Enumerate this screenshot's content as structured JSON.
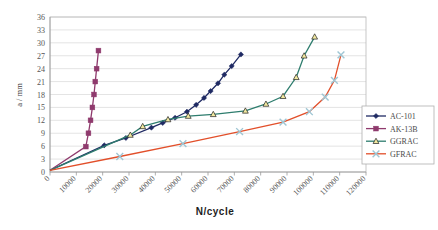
{
  "chart_data": {
    "type": "line",
    "title": "",
    "xlabel": "N/cycle",
    "ylabel": "a / mm",
    "xlim": [
      0,
      120000
    ],
    "ylim": [
      0,
      36
    ],
    "grid": true,
    "legend_position": "right-inside",
    "xticks": [
      0,
      10000,
      20000,
      30000,
      40000,
      50000,
      60000,
      70000,
      80000,
      90000,
      100000,
      110000,
      120000
    ],
    "xtick_labels": [
      "0",
      "10000",
      "20000",
      "30000",
      "40000",
      "50000",
      "60000",
      "70000",
      "80000",
      "90000",
      "100000",
      "110000",
      "120000"
    ],
    "yticks": [
      0,
      3,
      6,
      9,
      12,
      15,
      18,
      21,
      24,
      27,
      30,
      33,
      36
    ],
    "ytick_labels": [
      "0",
      "3",
      "6",
      "9",
      "12",
      "15",
      "18",
      "21",
      "24",
      "27",
      "30",
      "33",
      "36"
    ],
    "series": [
      {
        "name": "AC-101",
        "color": "#1f2a63",
        "marker": "diamond",
        "points": [
          [
            0,
            0.4
          ],
          [
            20600,
            6.2
          ],
          [
            28800,
            7.9
          ],
          [
            38500,
            10.3
          ],
          [
            42800,
            11.4
          ],
          [
            47500,
            12.6
          ],
          [
            52000,
            14.0
          ],
          [
            55500,
            15.6
          ],
          [
            58500,
            17.2
          ],
          [
            61000,
            18.8
          ],
          [
            63800,
            20.6
          ],
          [
            66200,
            22.6
          ],
          [
            69000,
            24.6
          ],
          [
            72500,
            27.3
          ]
        ]
      },
      {
        "name": "AK-13B",
        "color": "#8f3a6d",
        "marker": "square",
        "points": [
          [
            0,
            0.4
          ],
          [
            13600,
            5.9
          ],
          [
            14600,
            9.0
          ],
          [
            15400,
            12.0
          ],
          [
            16100,
            15.0
          ],
          [
            16700,
            18.0
          ],
          [
            17200,
            21.0
          ],
          [
            17700,
            24.0
          ],
          [
            18400,
            28.2
          ]
        ]
      },
      {
        "name": "GGRAC",
        "color": "#2e7d6e",
        "marker": "triangle",
        "points": [
          [
            0,
            0.4
          ],
          [
            30500,
            8.6
          ],
          [
            35200,
            10.6
          ],
          [
            44800,
            12.2
          ],
          [
            52500,
            13.0
          ],
          [
            62000,
            13.4
          ],
          [
            74200,
            14.2
          ],
          [
            82000,
            15.8
          ],
          [
            88500,
            17.6
          ],
          [
            93500,
            22.0
          ],
          [
            96500,
            27.0
          ],
          [
            100500,
            31.4
          ]
        ]
      },
      {
        "name": "GFRAC",
        "color": "#e24f2a",
        "marker": "cross",
        "points": [
          [
            0,
            0.4
          ],
          [
            26500,
            3.6
          ],
          [
            50500,
            6.6
          ],
          [
            72000,
            9.4
          ],
          [
            88500,
            11.6
          ],
          [
            98500,
            14.0
          ],
          [
            104500,
            17.4
          ],
          [
            108000,
            21.3
          ],
          [
            110500,
            27.2
          ]
        ]
      }
    ]
  },
  "legend": {
    "entries": [
      {
        "label": "AC-101",
        "color": "#1f2a63",
        "marker": "diamond"
      },
      {
        "label": "AK-13B",
        "color": "#8f3a6d",
        "marker": "square"
      },
      {
        "label": "GGRAC",
        "color": "#2e7d6e",
        "marker": "triangle"
      },
      {
        "label": "GFRAC",
        "color": "#e24f2a",
        "marker": "cross"
      }
    ]
  }
}
